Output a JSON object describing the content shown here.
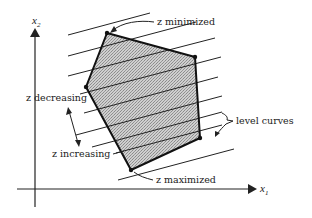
{
  "figure": {
    "type": "linear-programming-feasible-region",
    "axes": {
      "x_label": "x",
      "x_sub": "1",
      "y_label": "x",
      "y_sub": "2"
    },
    "annotations": {
      "minimized": "z minimized",
      "maximized": "z maximized",
      "decreasing": "z decreasing",
      "increasing": "z increasing",
      "level_curves": "level curves"
    },
    "polygon_vertices": [
      [
        107,
        33
      ],
      [
        195,
        57
      ],
      [
        200,
        138
      ],
      [
        131,
        170
      ],
      [
        86,
        87
      ]
    ],
    "colors": {
      "ink": "#222222",
      "fill": "#bdbdbd",
      "background": "#ffffff"
    }
  }
}
